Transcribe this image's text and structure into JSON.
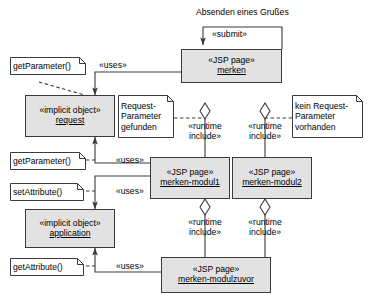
{
  "diagram": {
    "title_label": "Absenden eines Grußes",
    "nodes": [
      {
        "id": "merken",
        "stereotype": "«JSP page»",
        "name": "merken"
      },
      {
        "id": "request",
        "stereotype": "«implicit object»",
        "name": "request"
      },
      {
        "id": "modul1",
        "stereotype": "«JSP page»",
        "name": "merken-modul1"
      },
      {
        "id": "modul2",
        "stereotype": "«JSP page»",
        "name": "merken-modul2"
      },
      {
        "id": "application",
        "stereotype": "«implicit object»",
        "name": "application"
      },
      {
        "id": "modulzuvor",
        "stereotype": "«JSP page»",
        "name": "merken-modulzuvor"
      }
    ],
    "notes": [
      {
        "id": "note-getparameter-1",
        "lines": [
          "getParameter()"
        ]
      },
      {
        "id": "note-getparameter-2",
        "lines": [
          "getParameter()"
        ]
      },
      {
        "id": "note-setattribute",
        "lines": [
          "setAttribute()"
        ]
      },
      {
        "id": "note-getattribute",
        "lines": [
          "getAttribute()"
        ]
      },
      {
        "id": "note-request-found",
        "lines": [
          "Request-",
          "Parameter",
          "gefunden"
        ]
      },
      {
        "id": "note-request-absent",
        "lines": [
          "kein Request-",
          "Parameter",
          "vorhanden"
        ]
      }
    ],
    "edge_labels": [
      {
        "id": "submit",
        "text": "«submit»"
      },
      {
        "id": "uses-1",
        "text": "«uses»"
      },
      {
        "id": "uses-2",
        "text": "«uses»"
      },
      {
        "id": "uses-3",
        "text": "«uses»"
      },
      {
        "id": "uses-4",
        "text": "«uses»"
      },
      {
        "id": "runtime-1",
        "line1": "«runtime",
        "line2": "include»"
      },
      {
        "id": "runtime-2",
        "line1": "«runtime",
        "line2": "include»"
      },
      {
        "id": "runtime-3",
        "line1": "«runtime",
        "line2": "include»"
      },
      {
        "id": "runtime-4",
        "line1": "«runtime",
        "line2": "include»"
      }
    ],
    "colors": {
      "node_fill": "#e2e2e2",
      "note_fill": "#ffffff",
      "stroke": "#3a3a3a",
      "text": "#000000",
      "background": "#ffffff"
    }
  }
}
